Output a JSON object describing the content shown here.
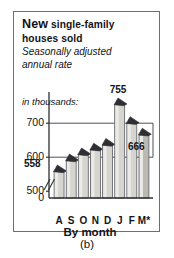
{
  "figure": {
    "caption": "(b)",
    "panel": {
      "title_primary": "New",
      "title_rest": "single-family",
      "title_line2": "houses sold",
      "subtitle_line1": "Seasonally adjusted",
      "subtitle_line2": "annual rate",
      "units_label": "in thousands:",
      "axis_title": "By month",
      "border_color": "#6b6f78"
    }
  },
  "chart_data": {
    "type": "bar",
    "subtitle": "Seasonally adjusted annual rate",
    "xlabel": "By month",
    "ylabel": "in thousands:",
    "categories": [
      "A",
      "S",
      "O",
      "N",
      "D",
      "J",
      "F",
      "M*"
    ],
    "values": [
      558,
      590,
      608,
      622,
      636,
      755,
      700,
      666
    ],
    "ytick_labels": [
      "700",
      "600",
      "500",
      "0"
    ],
    "ytick_values": [
      700,
      600,
      500,
      0
    ],
    "ylim": [
      480,
      780
    ],
    "axis_break": true,
    "grid": false,
    "legend": "none",
    "annotations": [
      {
        "text": "755",
        "category": "J",
        "value": 755
      },
      {
        "text": "558",
        "category": "A",
        "value": 558
      },
      {
        "text": "666",
        "category": "M*",
        "value": 666
      }
    ],
    "bar_fill": "#d6d4cf",
    "bar_edge": "#5a5d63",
    "roof_fill": "#2d2f33",
    "last_bar_fill": "#bcb9b3"
  }
}
